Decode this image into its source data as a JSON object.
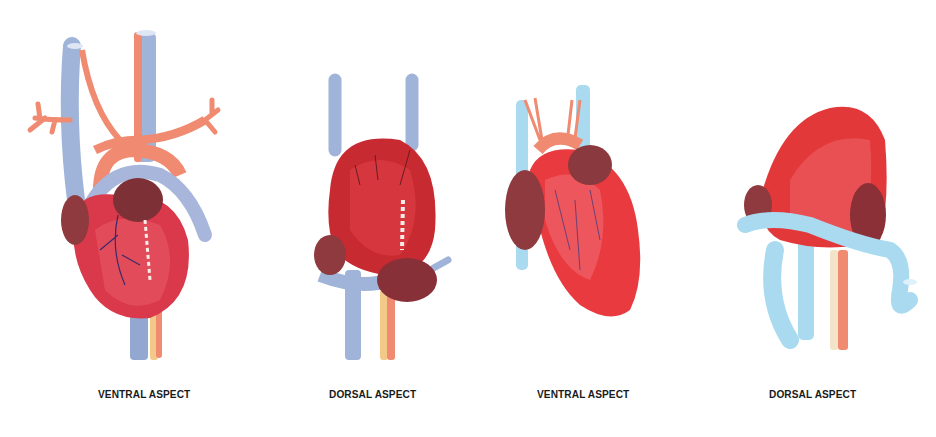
{
  "figure": {
    "background": "#ffffff",
    "colors": {
      "heart_red": "#e2383a",
      "heart_dark": "#b8232a",
      "atrium_brown": "#8e3a3e",
      "vein_blue": "#9fb4d8",
      "vein_light_blue": "#a9daf0",
      "artery_salmon": "#f08a70",
      "nerve_yellow": "#f3c98a"
    },
    "panels": [
      {
        "label": "VENTRAL ASPECT"
      },
      {
        "label": "DORSAL ASPECT"
      },
      {
        "label": "VENTRAL ASPECT"
      },
      {
        "label": "DORSAL ASPECT"
      }
    ]
  }
}
